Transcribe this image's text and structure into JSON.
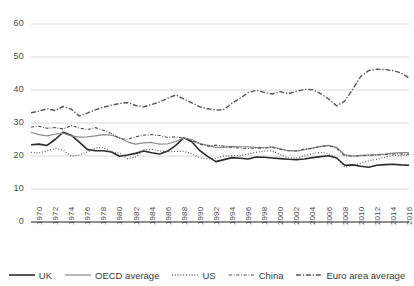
{
  "chart_data": {
    "type": "line",
    "title": "",
    "xlabel": "",
    "ylabel": "",
    "ylim": [
      0,
      60
    ],
    "xlim": [
      1970,
      2017
    ],
    "ytick_labels": [
      "60",
      "50",
      "40",
      "30",
      "20",
      "10",
      "0"
    ],
    "ytick_values": [
      60,
      50,
      40,
      30,
      20,
      10,
      0
    ],
    "grid": true,
    "legend_position": "bottom",
    "x": [
      1970,
      1971,
      1972,
      1973,
      1974,
      1975,
      1976,
      1977,
      1978,
      1979,
      1980,
      1981,
      1982,
      1983,
      1984,
      1985,
      1986,
      1987,
      1988,
      1989,
      1990,
      1991,
      1992,
      1993,
      1994,
      1995,
      1996,
      1997,
      1998,
      1999,
      2000,
      2001,
      2002,
      2003,
      2004,
      2005,
      2006,
      2007,
      2008,
      2009,
      2010,
      2011,
      2012,
      2013,
      2014,
      2015,
      2016,
      2017
    ],
    "xtick_labels": [
      "1970",
      "1972",
      "1974",
      "1976",
      "1978",
      "1980",
      "1982",
      "1984",
      "1986",
      "1988",
      "1990",
      "1992",
      "1994",
      "1996",
      "1998",
      "2000",
      "2002",
      "2004",
      "2006",
      "2008",
      "2010",
      "2012",
      "2014",
      "2016"
    ],
    "series": [
      {
        "name": "UK",
        "style": "solid",
        "color": "#2b2b2b",
        "width": 1.6,
        "values": [
          23.4,
          23.6,
          23.2,
          25.0,
          27.2,
          26.3,
          24.2,
          22.0,
          21.6,
          21.6,
          21.2,
          19.9,
          20.3,
          20.8,
          21.5,
          21.0,
          20.6,
          21.5,
          23.2,
          25.5,
          24.3,
          21.6,
          19.8,
          18.3,
          18.9,
          19.5,
          19.3,
          19.1,
          19.7,
          19.6,
          19.4,
          19.2,
          19.0,
          18.9,
          19.1,
          19.5,
          19.8,
          20.1,
          19.4,
          17.2,
          17.3,
          16.9,
          16.6,
          17.2,
          17.4,
          17.5,
          17.3,
          17.2
        ]
      },
      {
        "name": "OECD average",
        "style": "solid",
        "color": "#8a8a8a",
        "width": 1.2,
        "values": [
          27.2,
          26.5,
          26.1,
          26.6,
          26.9,
          26.1,
          25.7,
          25.8,
          26.1,
          26.5,
          26.3,
          25.6,
          24.3,
          23.6,
          24.0,
          24.1,
          23.6,
          23.7,
          24.4,
          25.4,
          25.0,
          23.8,
          23.2,
          22.6,
          22.6,
          22.9,
          22.8,
          22.8,
          22.6,
          22.5,
          22.8,
          22.2,
          21.6,
          21.5,
          21.9,
          22.4,
          22.9,
          23.2,
          22.6,
          20.4,
          20.0,
          20.2,
          20.3,
          20.4,
          20.6,
          20.9,
          21.0,
          21.0
        ]
      },
      {
        "name": "US",
        "style": "dotted",
        "color": "#555555",
        "width": 1.3,
        "values": [
          21.1,
          20.9,
          21.6,
          22.3,
          21.8,
          19.9,
          20.3,
          21.2,
          22.4,
          22.6,
          21.2,
          20.9,
          19.2,
          19.7,
          21.9,
          22.0,
          21.5,
          21.3,
          21.4,
          21.4,
          20.7,
          19.4,
          19.2,
          19.3,
          20.0,
          20.1,
          20.1,
          20.6,
          21.1,
          21.5,
          21.6,
          20.4,
          19.4,
          19.4,
          20.0,
          20.7,
          21.1,
          20.7,
          19.5,
          16.6,
          17.2,
          17.7,
          18.6,
          19.0,
          19.6,
          20.2,
          20.1,
          20.3
        ]
      },
      {
        "name": "China",
        "style": "dashdot-fine",
        "color": "#4f4f4f",
        "width": 1.1,
        "values": [
          28.8,
          29.0,
          28.4,
          28.6,
          28.2,
          29.2,
          28.5,
          28.0,
          28.6,
          27.8,
          26.8,
          25.3,
          25.1,
          25.8,
          26.3,
          26.5,
          26.2,
          25.6,
          25.8,
          25.4,
          24.6,
          23.6,
          23.0,
          23.3,
          23.0,
          22.6,
          22.4,
          22.3,
          22.4,
          22.4,
          22.6,
          22.0,
          21.6,
          21.6,
          22.1,
          22.4,
          22.8,
          23.2,
          22.3,
          20.1,
          19.9,
          20.0,
          20.2,
          20.3,
          20.5,
          20.6,
          20.6,
          20.5
        ]
      },
      {
        "name": "Euro area average",
        "style": "dashdot",
        "color": "#555555",
        "width": 1.4,
        "values": [
          33.1,
          33.6,
          34.3,
          33.8,
          35.0,
          34.2,
          32.1,
          33.0,
          34.0,
          34.8,
          35.4,
          35.9,
          36.2,
          35.3,
          34.9,
          35.6,
          36.4,
          37.5,
          38.5,
          37.3,
          36.1,
          34.9,
          34.3,
          33.9,
          34.1,
          36.0,
          37.5,
          39.2,
          39.9,
          39.3,
          38.8,
          39.5,
          38.9,
          39.6,
          40.2,
          40.1,
          38.9,
          37.3,
          35.2,
          36.6,
          40.2,
          44.1,
          45.9,
          46.3,
          46.2,
          45.9,
          45.2,
          43.6
        ]
      }
    ]
  }
}
